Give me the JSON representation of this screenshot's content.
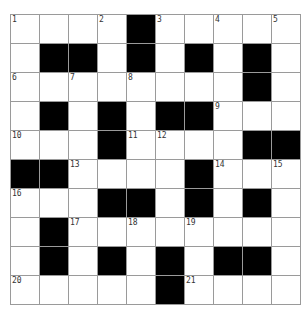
{
  "puzzle": {
    "rows": 10,
    "cols": 10,
    "colors": {
      "block": "#000000",
      "cell": "#ffffff",
      "gridline": "#9a9a9a"
    },
    "layout": [
      "1..2#3.4.5",
      ".##.#.#.#.",
      "6.7.8...#.",
      ".#.#.##9..",
      "10..#1112..##",
      "##13...#14.15",
      "16..##.#.#.",
      ".#17.18.19...",
      ".#.#.#.##.",
      "20....#21..."
    ],
    "grid": [
      [
        {
          "n": "1"
        },
        {},
        {},
        {
          "n": "2"
        },
        {
          "b": 1
        },
        {
          "n": "3"
        },
        {},
        {
          "n": "4"
        },
        {},
        {
          "n": "5"
        }
      ],
      [
        {},
        {
          "b": 1
        },
        {
          "b": 1
        },
        {},
        {
          "b": 1
        },
        {},
        {
          "b": 1
        },
        {},
        {
          "b": 1
        },
        {}
      ],
      [
        {
          "n": "6"
        },
        {},
        {
          "n": "7"
        },
        {},
        {
          "n": "8"
        },
        {},
        {},
        {},
        {
          "b": 1
        },
        {}
      ],
      [
        {},
        {
          "b": 1
        },
        {},
        {
          "b": 1
        },
        {},
        {
          "b": 1
        },
        {
          "b": 1
        },
        {
          "n": "9"
        },
        {},
        {}
      ],
      [
        {
          "n": "10"
        },
        {},
        {},
        {
          "b": 1
        },
        {
          "n": "11"
        },
        {
          "n": "12"
        },
        {},
        {},
        {
          "b": 1
        },
        {
          "b": 1
        }
      ],
      [
        {
          "b": 1
        },
        {
          "b": 1
        },
        {
          "n": "13"
        },
        {},
        {},
        {},
        {
          "b": 1
        },
        {
          "n": "14"
        },
        {},
        {
          "n": "15"
        }
      ],
      [
        {
          "n": "16"
        },
        {},
        {},
        {
          "b": 1
        },
        {
          "b": 1
        },
        {},
        {
          "b": 1
        },
        {},
        {
          "b": 1
        },
        {}
      ],
      [
        {},
        {
          "b": 1
        },
        {
          "n": "17"
        },
        {},
        {
          "n": "18"
        },
        {},
        {
          "n": "19"
        },
        {},
        {},
        {}
      ],
      [
        {},
        {
          "b": 1
        },
        {},
        {
          "b": 1
        },
        {},
        {
          "b": 1
        },
        {},
        {
          "b": 1
        },
        {
          "b": 1
        },
        {}
      ],
      [
        {
          "n": "20"
        },
        {},
        {},
        {},
        {},
        {
          "b": 1
        },
        {
          "n": "21"
        },
        {},
        {},
        {}
      ]
    ],
    "clue_numbers": [
      "1",
      "2",
      "3",
      "4",
      "5",
      "6",
      "7",
      "8",
      "9",
      "10",
      "11",
      "12",
      "13",
      "14",
      "15",
      "16",
      "17",
      "18",
      "19",
      "20",
      "21"
    ]
  }
}
